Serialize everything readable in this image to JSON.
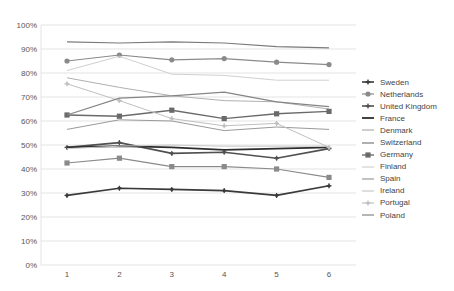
{
  "chart_data": {
    "type": "line",
    "title": "",
    "xlabel": "",
    "ylabel": "",
    "x": [
      1,
      2,
      3,
      4,
      5,
      6
    ],
    "ylim": [
      0,
      100
    ],
    "yticks": [
      "0%",
      "10%",
      "20%",
      "30%",
      "40%",
      "50%",
      "60%",
      "70%",
      "80%",
      "90%",
      "100%"
    ],
    "grid": true,
    "legend_position": "right",
    "series": [
      {
        "name": "Sweden",
        "color": "#3a3a3a",
        "marker": "star",
        "width": 1.6,
        "values": [
          29,
          32,
          31.5,
          31,
          29,
          33
        ]
      },
      {
        "name": "Netherlands",
        "color": "#8a8a8a",
        "marker": "circle",
        "width": 1.2,
        "values": [
          85,
          87.5,
          85.5,
          86,
          84.5,
          83.5
        ]
      },
      {
        "name": "United Kingdom",
        "color": "#505050",
        "marker": "star",
        "width": 1.6,
        "values": [
          49,
          51,
          46.5,
          47,
          44.5,
          48.5
        ]
      },
      {
        "name": "France",
        "color": "#2e2e2e",
        "marker": "none",
        "width": 1.8,
        "values": [
          49,
          49.5,
          49,
          48,
          48.5,
          49
        ]
      },
      {
        "name": "Denmark",
        "color": "#b0b0b0",
        "marker": "none",
        "width": 1.0,
        "values": [
          78,
          74,
          70.5,
          68.5,
          68,
          65
        ]
      },
      {
        "name": "Switzerland",
        "color": "#7a7a7a",
        "marker": "none",
        "width": 1.2,
        "values": [
          93,
          92.5,
          93,
          92.5,
          91,
          90.5
        ]
      },
      {
        "name": "Germany",
        "color": "#6a6a6a",
        "marker": "square",
        "width": 1.4,
        "values": [
          62.5,
          62,
          64.5,
          61,
          63,
          64
        ]
      },
      {
        "name": "Finland",
        "color": "#d0d0d0",
        "marker": "none",
        "width": 1.0,
        "values": [
          81,
          87,
          79.5,
          79,
          77,
          77
        ]
      },
      {
        "name": "Spain",
        "color": "#9a9a9a",
        "marker": "none",
        "width": 1.0,
        "values": [
          56.5,
          60.5,
          60,
          56,
          57.5,
          56.5
        ]
      },
      {
        "name": "Ireland",
        "color": "#c8c8c8",
        "marker": "none",
        "width": 1.0,
        "values": [
          48.5,
          49.5,
          50,
          49.5,
          49.5,
          49.5
        ]
      },
      {
        "name": "Portugal",
        "color": "#c0c0c0",
        "marker": "star",
        "width": 1.0,
        "values": [
          75.5,
          68.5,
          61,
          58,
          59,
          49
        ]
      },
      {
        "name": "Poland",
        "color": "#858585",
        "marker": "none",
        "width": 1.2,
        "values": [
          62.5,
          69.5,
          70.5,
          72,
          68,
          66
        ]
      },
      {
        "name": "Germany-2",
        "color": "#8a8a8a",
        "marker": "square",
        "width": 1.2,
        "values": [
          42.5,
          44.5,
          41,
          41,
          40,
          36.5
        ],
        "hidden_in_legend": true
      }
    ]
  },
  "legend": {
    "items": [
      "Sweden",
      "Netherlands",
      "United Kingdom",
      "France",
      "Denmark",
      "Switzerland",
      "Germany",
      "Finland",
      "Spain",
      "Ireland",
      "Portugal",
      "Poland"
    ]
  }
}
